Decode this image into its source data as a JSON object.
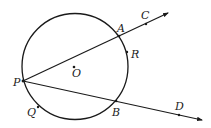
{
  "diagram": {
    "type": "geometry",
    "colors": {
      "stroke": "#1a1a1a",
      "label": "#222222",
      "background": "#ffffff"
    },
    "circle": {
      "center_label": "O",
      "cx": 75,
      "cy": 66.5,
      "r": 53
    },
    "points": [
      {
        "id": "P",
        "label": "P",
        "x": 23,
        "y": 81,
        "lx": 13,
        "ly": 86
      },
      {
        "id": "O",
        "label": "O",
        "x": 74,
        "y": 67,
        "lx": 72,
        "ly": 77
      },
      {
        "id": "A",
        "label": "A",
        "x": 119,
        "y": 36,
        "lx": 117,
        "ly": 32
      },
      {
        "id": "C",
        "label": "C",
        "x": 146,
        "y": 24,
        "lx": 141,
        "ly": 19
      },
      {
        "id": "R",
        "label": "R",
        "x": 127,
        "y": 52,
        "lx": 131,
        "ly": 58
      },
      {
        "id": "B",
        "label": "B",
        "x": 116,
        "y": 101,
        "lx": 112,
        "ly": 116
      },
      {
        "id": "D",
        "label": "D",
        "x": 179,
        "y": 115,
        "lx": 175,
        "ly": 110
      },
      {
        "id": "Q",
        "label": "Q",
        "x": 38,
        "y": 107,
        "lx": 27,
        "ly": 116
      }
    ],
    "rays": [
      {
        "from": "P",
        "through": [
          "A",
          "C"
        ],
        "x1": 23,
        "y1": 81,
        "x2": 168,
        "y2": 13
      },
      {
        "from": "P",
        "through": [
          "B",
          "D"
        ],
        "x1": 23,
        "y1": 81,
        "x2": 202,
        "y2": 120
      }
    ]
  }
}
